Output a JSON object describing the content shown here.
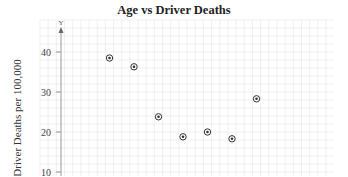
{
  "chart_data": {
    "type": "scatter",
    "title": "Age vs Driver Deaths",
    "xlabel": "",
    "ylabel": "Driver Deaths per 100,000",
    "y_axis_symbol": "Y",
    "yticks": [
      10,
      20,
      30,
      40
    ],
    "ylim": [
      0,
      45
    ],
    "grid": true,
    "legend": null,
    "series": [
      {
        "name": "Driver Deaths",
        "points": [
          {
            "x": 1,
            "y": 38.5
          },
          {
            "x": 2,
            "y": 36.3
          },
          {
            "x": 3,
            "y": 23.8
          },
          {
            "x": 4,
            "y": 18.8
          },
          {
            "x": 5,
            "y": 20.0
          },
          {
            "x": 6,
            "y": 18.3
          },
          {
            "x": 7,
            "y": 28.3
          }
        ]
      }
    ]
  },
  "colors": {
    "grid": "#e6e6e6",
    "axis": "#999999",
    "marker": "#333333"
  }
}
